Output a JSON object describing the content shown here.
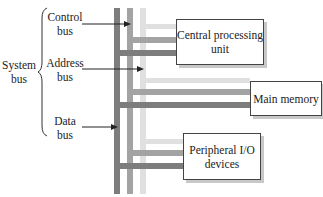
{
  "system_bus_label": "System\nbus",
  "buses": [
    {
      "id": "control",
      "label": "Control\nbus",
      "color": "#8a8a8a"
    },
    {
      "id": "address",
      "label": "Address\nbus",
      "color": "#e2e2e2"
    },
    {
      "id": "data",
      "label": "Data\nbus",
      "color": "#7a7a7a"
    }
  ],
  "bus_lines": {
    "dark": "#7d7d7d",
    "medium": "#a3a3a3",
    "light": "#e0e0e0"
  },
  "components": [
    {
      "id": "cpu",
      "label": "Central processing\nunit"
    },
    {
      "id": "memory",
      "label": "Main memory"
    },
    {
      "id": "io",
      "label": "Peripheral I/O\ndevices"
    }
  ]
}
